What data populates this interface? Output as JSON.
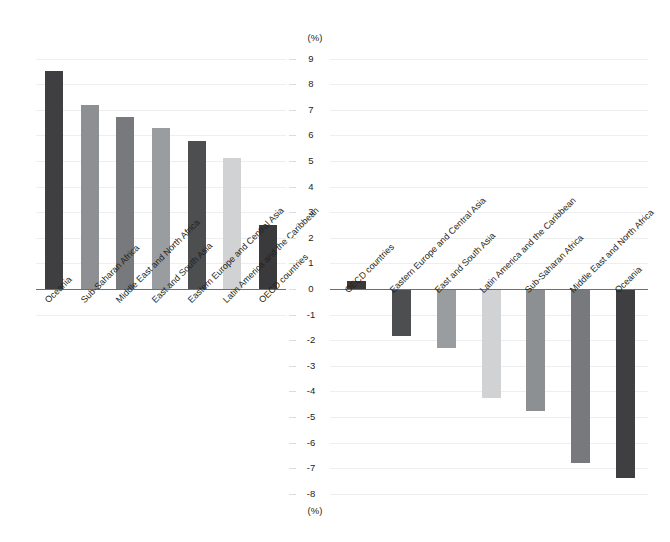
{
  "chart_data": [
    {
      "type": "bar",
      "panel": "left",
      "title": "",
      "xlabel": "",
      "ylabel": "(%)",
      "unit_top": "(%)",
      "ylim": [
        -1,
        9
      ],
      "yticks": [
        9,
        8,
        7,
        6,
        5,
        4,
        3,
        2,
        1,
        0,
        -1
      ],
      "grid": true,
      "legend": "none",
      "categories": [
        "Oceania",
        "Sub-Saharan Africa",
        "Middle East and North Africa",
        "East and South Asia",
        "Eastern Europe and Central Asia",
        "Latin America and the Caribbean",
        "OECD countries"
      ],
      "values": [
        8.5,
        7.2,
        6.7,
        6.3,
        5.8,
        5.1,
        2.5
      ],
      "colors": [
        "#3f3f41",
        "#8d9093",
        "#77797c",
        "#9a9da0",
        "#4c4e50",
        "#d0d2d3",
        "#3a3a3c"
      ]
    },
    {
      "type": "bar",
      "panel": "right",
      "title": "",
      "xlabel": "",
      "ylabel": "(%)",
      "unit_bottom": "(%)",
      "ylim": [
        -8,
        9
      ],
      "yticks": [
        9,
        8,
        7,
        6,
        5,
        4,
        3,
        2,
        1,
        0,
        -1,
        -2,
        -3,
        -4,
        -5,
        -6,
        -7,
        -8
      ],
      "grid": true,
      "legend": "none",
      "categories": [
        "OECD countries",
        "Eastern Europe and Central Asia",
        "East and South Asia",
        "Latin America and the Caribbean",
        "Sub-Saharan Africa",
        "Middle East and North Africa",
        "Oceania"
      ],
      "values": [
        0.3,
        -1.85,
        -2.3,
        -4.25,
        -4.75,
        -6.8,
        -7.4
      ],
      "colors": [
        "#3a3a3c",
        "#4c4e50",
        "#9a9da0",
        "#d0d2d3",
        "#8d9093",
        "#77797c",
        "#3f3f41"
      ]
    }
  ],
  "axis": {
    "unit_top": "(%)",
    "unit_bottom": "(%)"
  }
}
